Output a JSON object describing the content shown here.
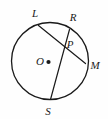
{
  "figure": {
    "name": "circle-with-two-chords",
    "background_color": "#fefefe",
    "stroke_color": "#1a1a1a",
    "label_color": "#1a1a1a",
    "circle": {
      "center_x": 50,
      "center_y": 61,
      "radius": 38.5,
      "stroke_width": 1.3
    },
    "center_dot": {
      "x": 48.5,
      "y": 62,
      "radius": 2.1
    },
    "points": [
      {
        "id": "L",
        "label": "L",
        "x": 38.5,
        "y": 25.5,
        "label_x": 35,
        "label_y": 14,
        "on_circle": true
      },
      {
        "id": "R",
        "label": "R",
        "x": 69.5,
        "y": 29.5,
        "label_x": 73,
        "label_y": 18,
        "on_circle": true
      },
      {
        "id": "P",
        "label": "P",
        "x": 63.5,
        "y": 44.5,
        "label_x": 70,
        "label_y": 45,
        "on_circle": false
      },
      {
        "id": "M",
        "label": "M",
        "x": 85.5,
        "y": 63.5,
        "label_x": 95,
        "label_y": 66,
        "on_circle": true
      },
      {
        "id": "S",
        "label": "S",
        "x": 50.5,
        "y": 99.5,
        "label_x": 48,
        "label_y": 112,
        "on_circle": true
      },
      {
        "id": "O",
        "label": "O",
        "x": 48.5,
        "y": 62,
        "label_x": 40,
        "label_y": 62,
        "on_circle": false
      }
    ],
    "chords": [
      {
        "id": "LM",
        "label": "L to M",
        "from": "L",
        "to": "M",
        "x1": 38.5,
        "y1": 25.5,
        "x2": 85.5,
        "y2": 63.5
      },
      {
        "id": "RS",
        "label": "R to S",
        "from": "R",
        "to": "S",
        "x1": 69.5,
        "y1": 29.5,
        "x2": 50.5,
        "y2": 99.5
      }
    ]
  }
}
